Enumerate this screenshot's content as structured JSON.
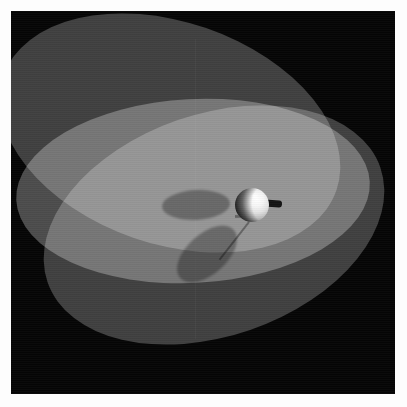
{
  "image": {
    "title": "Raytraced sphere with rod over three translucent elliptical disks",
    "kind": "3d-render",
    "width": 407,
    "height": 407,
    "border_label": "white photo mount border",
    "background_color": "#050505",
    "mount_color": "#fdfdfd"
  },
  "canvas": {
    "label": "render canvas",
    "x": 11,
    "y": 11,
    "width": 384,
    "height": 383,
    "background_color": "#050505"
  },
  "disks": [
    {
      "name": "disk-a",
      "label": "upper-left tilted translucent disk",
      "color": "#3c3c3c",
      "rotation_deg": 19,
      "center_x": 170,
      "center_y": 133,
      "radius_x": 176,
      "radius_y": 111
    },
    {
      "name": "disk-b",
      "label": "lower-left tilted translucent disk",
      "color": "#3c3c3c",
      "rotation_deg": -19,
      "center_x": 214,
      "center_y": 225,
      "radius_x": 176,
      "radius_y": 111
    },
    {
      "name": "disk-c",
      "label": "broad near-horizontal bright disk",
      "color": "#484848",
      "rotation_deg": -3,
      "center_x": 193,
      "center_y": 191,
      "radius_x": 177,
      "radius_y": 92
    }
  ],
  "sphere": {
    "label": "lit white sphere",
    "center_x": 252,
    "center_y": 205,
    "diameter": 34,
    "lit_color": "#ffffff",
    "shaded_color": "#1a1a1a",
    "highlight_color": "#ffffff"
  },
  "rod": {
    "label": "dark rod protruding right from sphere",
    "color": "#141414",
    "x": 262,
    "y": 200,
    "length": 20,
    "thickness": 7,
    "rotation_deg": 5
  },
  "shadows": [
    {
      "name": "shadow-upper",
      "label": "elliptical shadow cast on bright disk",
      "color": "#000000",
      "opacity": 0.3,
      "center_x": 196,
      "center_y": 205,
      "radius_x": 34,
      "radius_y": 15,
      "rotation_deg": -3
    },
    {
      "name": "shadow-lower",
      "label": "elongated elliptical shadow cast on lower disk",
      "color": "#000000",
      "opacity": 0.3,
      "center_x": 207,
      "center_y": 254,
      "radius_x": 36,
      "radius_y": 20,
      "rotation_deg": -42
    }
  ],
  "artifacts": {
    "seam_label": "faint vertical render seam",
    "grain_label": "scanline grain texture"
  }
}
